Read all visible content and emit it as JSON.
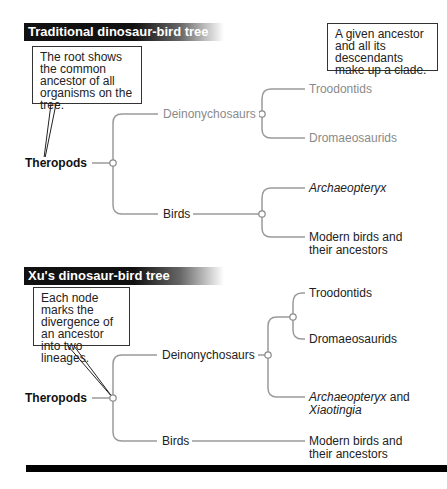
{
  "top_panel": {
    "title": "Traditional dinosaur-bird tree",
    "callout_root": "The root shows the common ancestor of all organisms on the tree.",
    "callout_clade": "A given ancestor and all its descendants make up a clade.",
    "root": "Theropods",
    "branches": {
      "deinonychosaurs": "Deinonychosaurs",
      "birds": "Birds",
      "troodontids": "Troodontids",
      "dromaeosaurids": "Dromaeosaurids",
      "archaeopteryx": "Archaeopteryx",
      "modern_birds_line1": "Modern birds and",
      "modern_birds_line2": "their ancestors"
    }
  },
  "bottom_panel": {
    "title": "Xu's dinosaur-bird tree",
    "callout_node": "Each node marks the divergence of an ancestor into two lineages.",
    "root": "Theropods",
    "branches": {
      "deinonychosaurs": "Deinonychosaurs",
      "birds": "Birds",
      "troodontids": "Troodontids",
      "dromaeosaurids": "Dromaeosaurids",
      "archaeopteryx": "Archaeopteryx",
      "and": " and",
      "xiaotingia": "Xiaotingia",
      "modern_birds_line1": "Modern birds and",
      "modern_birds_line2": "their ancestors"
    }
  },
  "colors": {
    "line": "#999999",
    "faded_text": "#8a8a8a",
    "header_bg": "#111111"
  }
}
